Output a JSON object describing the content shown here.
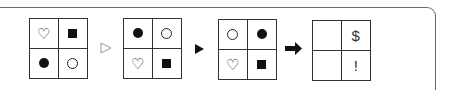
{
  "panels": [
    {
      "cells": [
        "heart-outline",
        "square-filled",
        "circle-filled",
        "circle-outline"
      ]
    },
    {
      "cells": [
        "circle-filled",
        "circle-outline",
        "heart-outline",
        "square-filled"
      ]
    },
    {
      "cells": [
        "circle-outline",
        "circle-filled",
        "heart-outline",
        "square-filled"
      ]
    },
    {
      "cells": [
        "",
        "$",
        "",
        "!"
      ]
    }
  ],
  "arrows": [
    {
      "type": "hollow-triangle",
      "glyph": "▷"
    },
    {
      "type": "filled-triangle",
      "glyph": "▶"
    },
    {
      "type": "thick-arrow",
      "glyph": "➡"
    }
  ],
  "symbols": {
    "heart": "♡",
    "dollar": "$",
    "exclamation": "!"
  }
}
